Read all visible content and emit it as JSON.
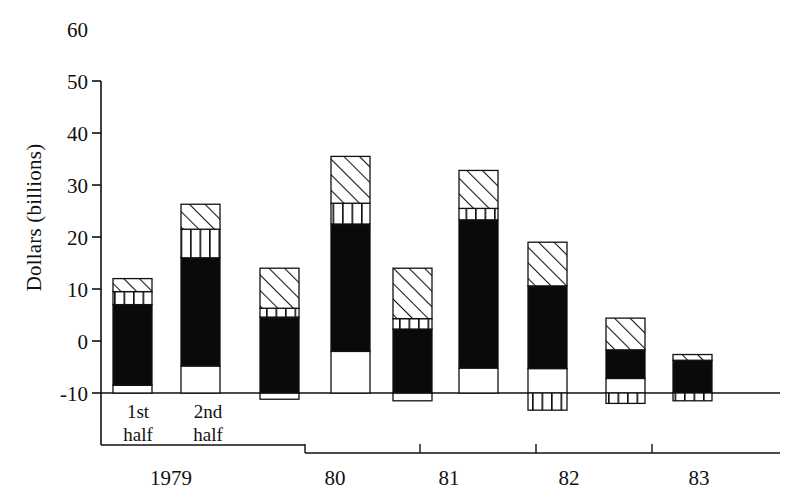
{
  "chart_data": {
    "type": "bar",
    "subtype": "stacked-bar-with-negatives",
    "title": "",
    "xlabel": "",
    "ylabel": "Dollars (billions)",
    "ylim": [
      -10,
      60
    ],
    "ytick_values": [
      -10,
      0,
      10,
      20,
      30,
      40,
      50,
      60
    ],
    "ytick_labels": [
      "-10",
      "0",
      "10",
      "20",
      "30",
      "40",
      "50",
      "60"
    ],
    "grid": false,
    "legend": "none",
    "x_group_labels": [
      "1979",
      "80",
      "81",
      "82",
      "83"
    ],
    "period_labels": [
      "1st half",
      "2nd half"
    ],
    "period_label_lines": [
      [
        "1st",
        "half"
      ],
      [
        "2nd",
        "half"
      ]
    ],
    "categories": [
      "1979 1st half",
      "1979 2nd half",
      "80 1st half",
      "80 2nd half",
      "81 1st half",
      "81 2nd half",
      "82 1st half",
      "82 2nd half",
      "83 1st half"
    ],
    "series": [
      {
        "name": "white-segment",
        "fill": "white",
        "values": [
          1.5,
          5.2,
          -1.2,
          8.0,
          -1.5,
          4.8,
          4.7,
          2.8,
          0.0
        ]
      },
      {
        "name": "black-segment",
        "fill": "solid-black",
        "values": [
          15.5,
          20.8,
          14.6,
          24.5,
          13.8,
          28.5,
          15.9,
          5.5,
          6.3
        ]
      },
      {
        "name": "vertical-stripe",
        "fill": "vertical-hatch",
        "values": [
          2.5,
          5.5,
          1.7,
          4.0,
          2.0,
          2.2,
          -3.3,
          -2.0,
          -1.5
        ]
      },
      {
        "name": "diagonal-hatch",
        "fill": "diagonal-hatch",
        "values": [
          2.5,
          4.8,
          7.7,
          9.0,
          9.7,
          7.3,
          8.4,
          6.1,
          1.1
        ]
      }
    ],
    "bars": [
      {
        "label": "1979 1st half",
        "white": [
          0,
          1.5
        ],
        "black": [
          1.5,
          17.0
        ],
        "vstripe": [
          17.0,
          19.5
        ],
        "diag": [
          19.5,
          22.0
        ],
        "total": 22.0
      },
      {
        "label": "1979 2nd half",
        "white": [
          0,
          5.2
        ],
        "black": [
          5.2,
          26.0
        ],
        "vstripe": [
          26.0,
          31.5
        ],
        "diag": [
          31.5,
          36.3
        ],
        "total": 36.3
      },
      {
        "label": "80 1st half",
        "white": [
          -1.2,
          0
        ],
        "black": [
          0,
          14.6
        ],
        "vstripe": [
          14.6,
          16.3
        ],
        "diag": [
          16.3,
          24.0
        ],
        "total": 24.0
      },
      {
        "label": "80 2nd half",
        "white": [
          0,
          8.0
        ],
        "black": [
          8.0,
          32.5
        ],
        "vstripe": [
          32.5,
          36.5
        ],
        "diag": [
          36.5,
          45.5
        ],
        "total": 45.5
      },
      {
        "label": "81 1st half",
        "white": [
          -1.5,
          0
        ],
        "black": [
          0,
          12.3
        ],
        "vstripe": [
          12.3,
          14.3
        ],
        "diag": [
          14.3,
          24.0
        ],
        "total": 24.0
      },
      {
        "label": "81 2nd half",
        "white": [
          0,
          4.8
        ],
        "black": [
          4.8,
          33.3
        ],
        "vstripe": [
          33.3,
          35.5
        ],
        "diag": [
          35.5,
          42.8
        ],
        "total": 42.8
      },
      {
        "label": "82 1st half",
        "white": [
          0,
          4.7
        ],
        "black": [
          4.7,
          20.6
        ],
        "vstripe": [
          -3.3,
          0
        ],
        "diag": [
          20.6,
          29.0
        ],
        "total": 29.0
      },
      {
        "label": "82 2nd half",
        "white": [
          0,
          2.8
        ],
        "black": [
          2.8,
          8.3
        ],
        "vstripe": [
          -2.0,
          0
        ],
        "diag": [
          8.3,
          14.4
        ],
        "total": 14.4
      },
      {
        "label": "83 1st half",
        "white": null,
        "black": [
          0,
          6.3
        ],
        "vstripe": [
          -1.5,
          0
        ],
        "diag": [
          6.3,
          7.4
        ],
        "total": 7.4
      }
    ]
  },
  "axes": {
    "y_label": "Dollars (billions)",
    "y_ticks": [
      {
        "value": 60,
        "label": "60"
      },
      {
        "value": 50,
        "label": "50"
      },
      {
        "value": 40,
        "label": "40"
      },
      {
        "value": 30,
        "label": "30"
      },
      {
        "value": 20,
        "label": "20"
      },
      {
        "value": 10,
        "label": "10"
      },
      {
        "value": 0,
        "label": "0"
      },
      {
        "value": -10,
        "label": "-10"
      }
    ],
    "x_groups": [
      {
        "label": "1979"
      },
      {
        "label": "80"
      },
      {
        "label": "81"
      },
      {
        "label": "82"
      },
      {
        "label": "83"
      }
    ],
    "period_annotations": [
      {
        "line1": "1st",
        "line2": "half"
      },
      {
        "line1": "2nd",
        "line2": "half"
      }
    ]
  },
  "colors": {
    "ink": "#111111",
    "black_fill": "#0a0a0a",
    "paper": "#ffffff"
  }
}
